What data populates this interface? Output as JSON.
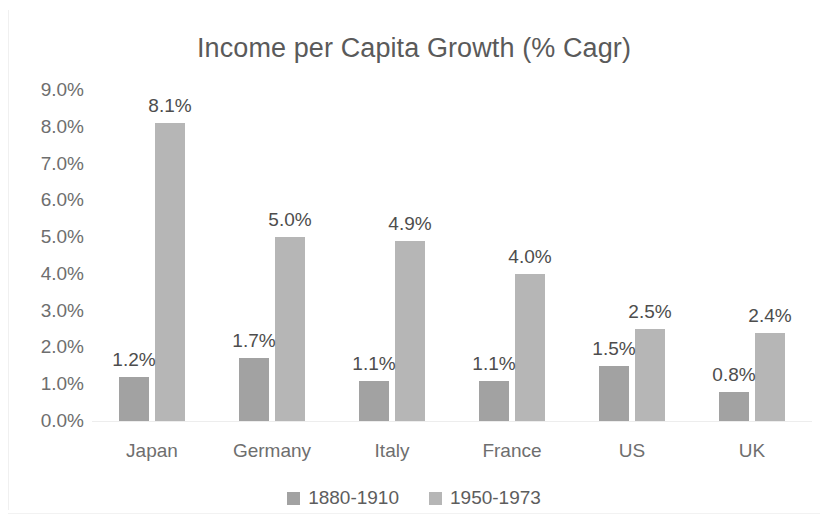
{
  "chart_data": {
    "type": "bar",
    "title": "Income per Capita Growth (% Cagr)",
    "xlabel": "",
    "ylabel": "",
    "categories": [
      "Japan",
      "Germany",
      "Italy",
      "France",
      "US",
      "UK"
    ],
    "series": [
      {
        "name": "1880-1910",
        "color": "#a2a2a2",
        "values": [
          1.2,
          1.7,
          1.1,
          1.1,
          1.5,
          0.8
        ],
        "labels": [
          "1.2%",
          "1.7%",
          "1.1%",
          "1.1%",
          "1.5%",
          "0.8%"
        ]
      },
      {
        "name": "1950-1973",
        "color": "#b6b6b6",
        "values": [
          8.1,
          5.0,
          4.9,
          4.0,
          2.5,
          2.4
        ],
        "labels": [
          "8.1%",
          "5.0%",
          "4.9%",
          "4.0%",
          "2.5%",
          "2.4%"
        ]
      }
    ],
    "ylim": [
      0,
      9
    ],
    "ytick_values": [
      9,
      8,
      7,
      6,
      5,
      4,
      3,
      2,
      1,
      0
    ],
    "ytick_labels": [
      "9.0%",
      "8.0%",
      "7.0%",
      "6.0%",
      "5.0%",
      "4.0%",
      "3.0%",
      "2.0%",
      "1.0%",
      "0.0%"
    ],
    "grid": false,
    "data_labels": true,
    "legend_position": "bottom",
    "background_color": "#ffffff",
    "title_color": "#5a5a5a",
    "tick_color": "#6e6e6e"
  }
}
